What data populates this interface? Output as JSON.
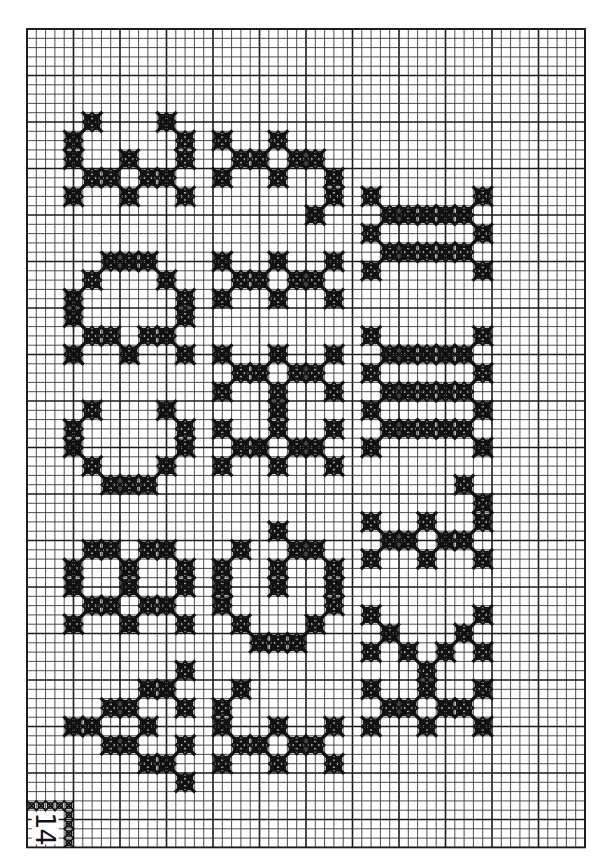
{
  "chart": {
    "page_number": "14",
    "grid": {
      "cols": 60,
      "rows": 88,
      "origin_x": 27,
      "origin_y": 29,
      "cell": 9.3,
      "major_every": 5,
      "line_color": "#3a3a3a",
      "major_line_color": "#1a1a1a",
      "stitch_color": "#111111",
      "background": "#ffffff"
    },
    "motifs": [
      {
        "name": "motif-col1-1",
        "stitches": [
          [
            6,
            9
          ],
          [
            14,
            9
          ],
          [
            4,
            11
          ],
          [
            4,
            13
          ],
          [
            16,
            11
          ],
          [
            16,
            13
          ],
          [
            10,
            13
          ],
          [
            6,
            15
          ],
          [
            8,
            15
          ],
          [
            12,
            15
          ],
          [
            14,
            15
          ],
          [
            4,
            17
          ],
          [
            10,
            17
          ],
          [
            16,
            17
          ]
        ]
      },
      {
        "name": "motif-col1-2",
        "stitches": [
          [
            8,
            24
          ],
          [
            10,
            24
          ],
          [
            12,
            24
          ],
          [
            6,
            26
          ],
          [
            14,
            26
          ],
          [
            4,
            28
          ],
          [
            4,
            30
          ],
          [
            16,
            28
          ],
          [
            16,
            30
          ],
          [
            6,
            32
          ],
          [
            8,
            32
          ],
          [
            12,
            32
          ],
          [
            14,
            32
          ],
          [
            4,
            34
          ],
          [
            10,
            34
          ],
          [
            16,
            34
          ]
        ]
      },
      {
        "name": "motif-col1-3",
        "stitches": [
          [
            6,
            40
          ],
          [
            14,
            40
          ],
          [
            4,
            42
          ],
          [
            4,
            44
          ],
          [
            16,
            42
          ],
          [
            16,
            44
          ],
          [
            6,
            46
          ],
          [
            14,
            46
          ],
          [
            8,
            48
          ],
          [
            10,
            48
          ],
          [
            12,
            48
          ]
        ]
      },
      {
        "name": "motif-col1-4",
        "stitches": [
          [
            6,
            55
          ],
          [
            8,
            55
          ],
          [
            12,
            55
          ],
          [
            14,
            55
          ],
          [
            4,
            57
          ],
          [
            4,
            59
          ],
          [
            10,
            57
          ],
          [
            10,
            59
          ],
          [
            16,
            57
          ],
          [
            16,
            59
          ],
          [
            6,
            61
          ],
          [
            8,
            61
          ],
          [
            12,
            61
          ],
          [
            14,
            61
          ],
          [
            4,
            63
          ],
          [
            10,
            63
          ],
          [
            16,
            63
          ]
        ]
      },
      {
        "name": "motif-col1-5",
        "stitches": [
          [
            16,
            68
          ],
          [
            12,
            70
          ],
          [
            14,
            70
          ],
          [
            8,
            72
          ],
          [
            10,
            72
          ],
          [
            16,
            72
          ],
          [
            4,
            74
          ],
          [
            6,
            74
          ],
          [
            12,
            74
          ],
          [
            8,
            76
          ],
          [
            10,
            76
          ],
          [
            16,
            76
          ],
          [
            12,
            78
          ],
          [
            14,
            78
          ],
          [
            16,
            80
          ]
        ]
      },
      {
        "name": "motif-col2-1",
        "stitches": [
          [
            20,
            11
          ],
          [
            26,
            11
          ],
          [
            22,
            13
          ],
          [
            24,
            13
          ],
          [
            28,
            13
          ],
          [
            30,
            13
          ],
          [
            20,
            15
          ],
          [
            26,
            15
          ],
          [
            32,
            15
          ],
          [
            32,
            17
          ],
          [
            30,
            19
          ]
        ]
      },
      {
        "name": "motif-col2-2",
        "stitches": [
          [
            20,
            24
          ],
          [
            26,
            24
          ],
          [
            32,
            24
          ],
          [
            22,
            26
          ],
          [
            24,
            26
          ],
          [
            28,
            26
          ],
          [
            30,
            26
          ],
          [
            20,
            28
          ],
          [
            26,
            28
          ],
          [
            32,
            28
          ]
        ]
      },
      {
        "name": "motif-col2-3",
        "stitches": [
          [
            20,
            34
          ],
          [
            26,
            34
          ],
          [
            32,
            34
          ],
          [
            22,
            36
          ],
          [
            24,
            36
          ],
          [
            28,
            36
          ],
          [
            30,
            36
          ],
          [
            20,
            38
          ],
          [
            32,
            38
          ],
          [
            26,
            38
          ],
          [
            26,
            40
          ],
          [
            26,
            42
          ],
          [
            20,
            42
          ],
          [
            32,
            42
          ],
          [
            22,
            44
          ],
          [
            24,
            44
          ],
          [
            28,
            44
          ],
          [
            30,
            44
          ],
          [
            20,
            46
          ],
          [
            26,
            46
          ],
          [
            32,
            46
          ]
        ]
      },
      {
        "name": "motif-col2-4",
        "stitches": [
          [
            26,
            53
          ],
          [
            22,
            55
          ],
          [
            28,
            55
          ],
          [
            30,
            55
          ],
          [
            20,
            57
          ],
          [
            20,
            59
          ],
          [
            20,
            61
          ],
          [
            26,
            57
          ],
          [
            26,
            59
          ],
          [
            32,
            57
          ],
          [
            32,
            59
          ],
          [
            32,
            61
          ],
          [
            22,
            63
          ],
          [
            30,
            63
          ],
          [
            24,
            65
          ],
          [
            26,
            65
          ],
          [
            28,
            65
          ]
        ]
      },
      {
        "name": "motif-col2-5",
        "stitches": [
          [
            22,
            70
          ],
          [
            20,
            72
          ],
          [
            20,
            74
          ],
          [
            26,
            74
          ],
          [
            32,
            74
          ],
          [
            22,
            76
          ],
          [
            24,
            76
          ],
          [
            28,
            76
          ],
          [
            30,
            76
          ],
          [
            20,
            78
          ],
          [
            26,
            78
          ],
          [
            32,
            78
          ]
        ]
      },
      {
        "name": "motif-col3-1",
        "stitches": [
          [
            36,
            17
          ],
          [
            48,
            17
          ],
          [
            38,
            19
          ],
          [
            40,
            19
          ],
          [
            42,
            19
          ],
          [
            44,
            19
          ],
          [
            46,
            19
          ],
          [
            36,
            21
          ],
          [
            48,
            21
          ],
          [
            38,
            23
          ],
          [
            40,
            23
          ],
          [
            42,
            23
          ],
          [
            44,
            23
          ],
          [
            46,
            23
          ],
          [
            36,
            25
          ],
          [
            48,
            25
          ]
        ]
      },
      {
        "name": "motif-col3-2",
        "stitches": [
          [
            36,
            32
          ],
          [
            48,
            32
          ],
          [
            38,
            34
          ],
          [
            40,
            34
          ],
          [
            42,
            34
          ],
          [
            44,
            34
          ],
          [
            46,
            34
          ],
          [
            36,
            36
          ],
          [
            48,
            36
          ],
          [
            38,
            38
          ],
          [
            40,
            38
          ],
          [
            42,
            38
          ],
          [
            44,
            38
          ],
          [
            46,
            38
          ],
          [
            36,
            40
          ],
          [
            48,
            40
          ],
          [
            38,
            42
          ],
          [
            40,
            42
          ],
          [
            42,
            42
          ],
          [
            44,
            42
          ],
          [
            46,
            42
          ],
          [
            36,
            44
          ],
          [
            48,
            44
          ]
        ]
      },
      {
        "name": "motif-col3-3",
        "stitches": [
          [
            46,
            48
          ],
          [
            48,
            50
          ],
          [
            48,
            52
          ],
          [
            36,
            52
          ],
          [
            42,
            52
          ],
          [
            38,
            54
          ],
          [
            40,
            54
          ],
          [
            44,
            54
          ],
          [
            46,
            54
          ],
          [
            36,
            56
          ],
          [
            42,
            56
          ],
          [
            48,
            56
          ]
        ]
      },
      {
        "name": "motif-col3-4",
        "stitches": [
          [
            36,
            62
          ],
          [
            48,
            62
          ],
          [
            38,
            64
          ],
          [
            46,
            64
          ],
          [
            36,
            66
          ],
          [
            40,
            66
          ],
          [
            44,
            66
          ],
          [
            48,
            66
          ],
          [
            42,
            68
          ],
          [
            42,
            70
          ],
          [
            36,
            70
          ],
          [
            48,
            70
          ],
          [
            38,
            72
          ],
          [
            40,
            72
          ],
          [
            44,
            72
          ],
          [
            46,
            72
          ],
          [
            36,
            74
          ],
          [
            42,
            74
          ],
          [
            48,
            74
          ]
        ]
      }
    ],
    "page_frame_stitches": [
      [
        0,
        83
      ],
      [
        1,
        83
      ],
      [
        2,
        83
      ],
      [
        3,
        83
      ],
      [
        4,
        83
      ],
      [
        4,
        84
      ],
      [
        4,
        85
      ],
      [
        4,
        86
      ],
      [
        4,
        87
      ]
    ]
  }
}
